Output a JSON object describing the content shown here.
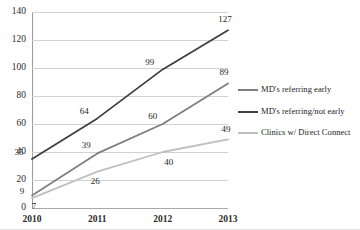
{
  "chart_data": {
    "type": "line",
    "title": "",
    "xlabel": "",
    "ylabel": "",
    "categories": [
      "2010",
      "2011",
      "2012",
      "2013"
    ],
    "ylim": [
      0,
      140
    ],
    "ytick_values": [
      140,
      120,
      100,
      80,
      60,
      40,
      20,
      0
    ],
    "ytick_labels": [
      "140",
      "120",
      "100",
      "80",
      "60",
      "40",
      "20",
      "0"
    ],
    "grid": true,
    "legend_position": "right",
    "series": [
      {
        "name": "MD's referring early",
        "color": "#7f7f7f",
        "values": [
          9,
          39,
          60,
          89
        ],
        "labels": [
          "9",
          "39",
          "60",
          "89"
        ]
      },
      {
        "name": "MD's referring/not early",
        "color": "#404040",
        "values": [
          35,
          64,
          99,
          127
        ],
        "labels": [
          "35",
          "64",
          "99",
          "127"
        ]
      },
      {
        "name": "Clinics w/ Direct Connect",
        "color": "#bfbfbf",
        "values": [
          7,
          26,
          40,
          49
        ],
        "labels": [
          "7",
          "26",
          "40",
          "49"
        ]
      }
    ]
  },
  "legend": {
    "items": [
      {
        "label": "MD's referring early",
        "color": "#7f7f7f"
      },
      {
        "label": "MD's referring/not early",
        "color": "#404040"
      },
      {
        "label": "Clinics w/ Direct Connect",
        "color": "#bfbfbf"
      }
    ]
  }
}
